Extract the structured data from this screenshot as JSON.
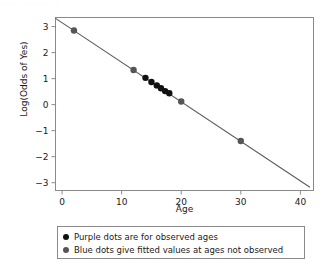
{
  "scan": {
    "header_remnant": "·  ····   ·····      ·· ··   ··"
  },
  "colors": {
    "observed_dot": "#111111",
    "fitted_dot": "#555555",
    "line": "#5a5a5a",
    "frame": "#8a8a8a",
    "text": "#1a1a1a",
    "legend_border": "#8a8a8a",
    "background": "#ffffff"
  },
  "legend": {
    "entries": [
      {
        "marker": "purple-dot",
        "color": "#111111",
        "label": "Purple dots are for observed ages"
      },
      {
        "marker": "blue-dot",
        "color": "#555555",
        "label": "Blue dots give fitted values at ages not observed"
      }
    ]
  },
  "chart_data": {
    "type": "scatter",
    "title": "",
    "subtitle": "",
    "xlabel": "Age",
    "ylabel": "Log(Odds of Yes)",
    "xlim": [
      -1.1,
      42.2
    ],
    "ylim": [
      -3.3,
      3.35
    ],
    "xticks": [
      0,
      10,
      20,
      30,
      40
    ],
    "xticklabels": [
      "0",
      "10",
      "20",
      "30",
      "40"
    ],
    "yticks": [
      3,
      2,
      1,
      0,
      -1,
      -2,
      -3
    ],
    "yticklabels": [
      "3",
      "2",
      "1",
      "0",
      "−1",
      "−2",
      "−3"
    ],
    "grid": false,
    "legend_position": "below-axes",
    "fit_line": {
      "name": "Fitted logistic log-odds line",
      "intercept": 3.15,
      "slope": -0.152,
      "x_start": -1.1,
      "x_end": 41.6,
      "color": "#5a5a5a"
    },
    "series": [
      {
        "name": "Blue dots give fitted values at ages not observed",
        "marker": "fitted",
        "color": "#555555",
        "points": [
          {
            "x": 2,
            "y": 2.85
          },
          {
            "x": 12,
            "y": 1.33
          },
          {
            "x": 20,
            "y": 0.12
          },
          {
            "x": 30,
            "y": -1.4
          }
        ]
      },
      {
        "name": "Purple dots are for observed ages",
        "marker": "observed",
        "color": "#111111",
        "points": [
          {
            "x": 14.0,
            "y": 1.03
          },
          {
            "x": 15.0,
            "y": 0.87
          },
          {
            "x": 15.9,
            "y": 0.74
          },
          {
            "x": 16.6,
            "y": 0.63
          },
          {
            "x": 17.3,
            "y": 0.52
          },
          {
            "x": 18.0,
            "y": 0.44
          }
        ]
      }
    ]
  }
}
